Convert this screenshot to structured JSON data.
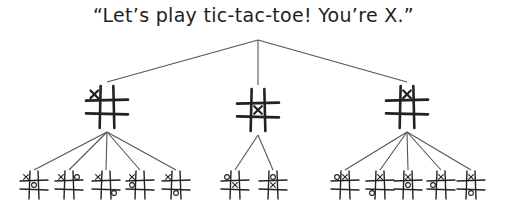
{
  "title": "“Let’s play tic-tac-toe! You’re X.”",
  "root": {
    "x": 258,
    "y": 40
  },
  "level1": [
    {
      "id": "L",
      "x": 107,
      "y": 107,
      "size": 38,
      "marks": [
        {
          "cell": 0,
          "p": "X"
        }
      ],
      "children": [
        {
          "x": 34,
          "y": 185,
          "size": 24,
          "marks": [
            {
              "cell": 0,
              "p": "X"
            },
            {
              "cell": 4,
              "p": "O"
            }
          ]
        },
        {
          "x": 69,
          "y": 185,
          "size": 24,
          "marks": [
            {
              "cell": 0,
              "p": "X"
            },
            {
              "cell": 2,
              "p": "O"
            }
          ]
        },
        {
          "x": 106,
          "y": 185,
          "size": 24,
          "marks": [
            {
              "cell": 0,
              "p": "X"
            },
            {
              "cell": 8,
              "p": "O"
            }
          ]
        },
        {
          "x": 140,
          "y": 185,
          "size": 24,
          "marks": [
            {
              "cell": 0,
              "p": "X"
            },
            {
              "cell": 3,
              "p": "O"
            }
          ]
        },
        {
          "x": 176,
          "y": 185,
          "size": 24,
          "marks": [
            {
              "cell": 0,
              "p": "X"
            },
            {
              "cell": 7,
              "p": "O"
            }
          ]
        }
      ]
    },
    {
      "id": "M",
      "x": 258,
      "y": 110,
      "size": 38,
      "marks": [
        {
          "cell": 4,
          "p": "X"
        }
      ],
      "children": [
        {
          "x": 235,
          "y": 185,
          "size": 24,
          "marks": [
            {
              "cell": 4,
              "p": "X"
            },
            {
              "cell": 0,
              "p": "O"
            }
          ]
        },
        {
          "x": 273,
          "y": 185,
          "size": 24,
          "marks": [
            {
              "cell": 4,
              "p": "X"
            },
            {
              "cell": 1,
              "p": "O"
            }
          ]
        }
      ]
    },
    {
      "id": "R",
      "x": 407,
      "y": 107,
      "size": 38,
      "marks": [
        {
          "cell": 1,
          "p": "X"
        }
      ],
      "children": [
        {
          "x": 345,
          "y": 185,
          "size": 24,
          "marks": [
            {
              "cell": 1,
              "p": "X"
            },
            {
              "cell": 0,
              "p": "O"
            }
          ]
        },
        {
          "x": 380,
          "y": 185,
          "size": 24,
          "marks": [
            {
              "cell": 1,
              "p": "X"
            },
            {
              "cell": 6,
              "p": "O"
            }
          ]
        },
        {
          "x": 408,
          "y": 185,
          "size": 24,
          "marks": [
            {
              "cell": 1,
              "p": "X"
            },
            {
              "cell": 4,
              "p": "O"
            }
          ]
        },
        {
          "x": 441,
          "y": 185,
          "size": 24,
          "marks": [
            {
              "cell": 1,
              "p": "X"
            },
            {
              "cell": 3,
              "p": "O"
            }
          ]
        },
        {
          "x": 471,
          "y": 185,
          "size": 24,
          "marks": [
            {
              "cell": 1,
              "p": "X"
            },
            {
              "cell": 7,
              "p": "O"
            }
          ]
        }
      ]
    }
  ]
}
